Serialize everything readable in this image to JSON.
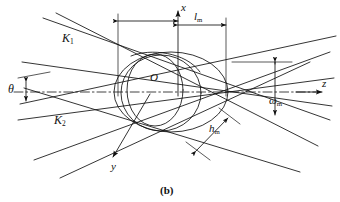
{
  "figure": {
    "caption": "(b)",
    "background_color": "#ffffff",
    "stroke_color": "#111111"
  },
  "axes": [
    {
      "id": "x",
      "label": "x",
      "direction": "up",
      "tip": [
        178,
        12
      ],
      "label_pos": [
        181,
        4
      ]
    },
    {
      "id": "y",
      "label": "y",
      "direction": "down-left",
      "tip": [
        112,
        160
      ],
      "label_pos": [
        112,
        166
      ]
    },
    {
      "id": "z",
      "label": "z",
      "direction": "right",
      "tip": [
        324,
        92
      ],
      "label_pos": [
        322,
        80
      ]
    }
  ],
  "origin": {
    "label": "O",
    "pos": [
      152,
      78
    ],
    "point": [
      146,
      92
    ]
  },
  "vectors": [
    {
      "id": "K1",
      "base": "K",
      "sub": "1",
      "label_pos": [
        64,
        38
      ]
    },
    {
      "id": "K2",
      "base": "K",
      "sub": "2",
      "label_pos": [
        56,
        120
      ]
    }
  ],
  "dimensions": [
    {
      "id": "lm",
      "base": "l",
      "sub": "m",
      "label_pos": [
        196,
        16
      ],
      "kind": "horizontal-extent"
    },
    {
      "id": "wm",
      "base": "ω",
      "sub": "m",
      "label_pos": [
        272,
        101
      ],
      "kind": "vertical-extent"
    },
    {
      "id": "hm",
      "base": "h",
      "sub": "m",
      "label_pos": [
        210,
        128
      ],
      "kind": "oblique-extent"
    }
  ],
  "angles": [
    {
      "id": "theta",
      "label": "θ",
      "label_pos": [
        11,
        88
      ]
    }
  ]
}
